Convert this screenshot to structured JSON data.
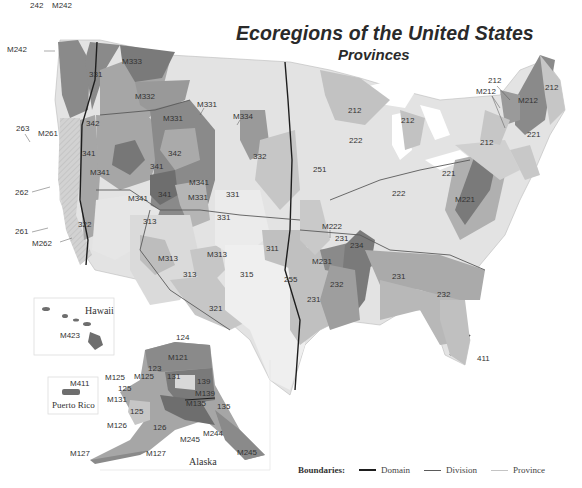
{
  "title": "Ecoregions of the United States",
  "subtitle": "Provinces",
  "colors": {
    "domain_line": "#1e1e1e",
    "division_line": "#5a5a5a",
    "province_line": "#b4b4b4",
    "tone_darkest": "#6e6e6e",
    "tone_dark": "#8a8a8a",
    "tone_mid": "#a6a6a6",
    "tone_light": "#c2c2c2",
    "tone_lighter": "#d6d6d6",
    "tone_lightest": "#e8e8e8"
  },
  "regions": {
    "northwest": [
      "242",
      "M242",
      "M242",
      "263",
      "M261",
      "262",
      "261",
      "M262",
      "M333",
      "331",
      "M332",
      "342",
      "M331",
      "M331",
      "341",
      "M341",
      "342",
      "341",
      "M341",
      "M341",
      "341",
      "M331"
    ],
    "southwest": [
      "322",
      "313",
      "M313",
      "M313",
      "313",
      "321",
      "331",
      "331",
      "M334",
      "332",
      "315",
      "311",
      "255"
    ],
    "central": [
      "251",
      "212",
      "212",
      "212",
      "222",
      "222",
      "M222",
      "231",
      "234",
      "M231",
      "232",
      "231",
      "231",
      "232",
      "411"
    ],
    "northeast": [
      "212",
      "M212",
      "212",
      "M212",
      "221",
      "212",
      "221",
      "M221"
    ]
  },
  "insets": {
    "hawaii": {
      "name": "Hawaii",
      "labels": [
        "M423"
      ]
    },
    "puerto_rico": {
      "name": "Puerto Rico",
      "labels": [
        "M411"
      ]
    },
    "alaska": {
      "name": "Alaska",
      "labels": [
        "124",
        "M121",
        "M125",
        "125",
        "M125",
        "123",
        "131",
        "139",
        "M139",
        "M131",
        "125",
        "M135",
        "135",
        "M126",
        "126",
        "M245",
        "M244",
        "M245",
        "M127",
        "M127"
      ]
    }
  },
  "legend": {
    "title": "Boundaries:",
    "items": [
      {
        "label": "Domain"
      },
      {
        "label": "Division"
      },
      {
        "label": "Province"
      }
    ]
  }
}
